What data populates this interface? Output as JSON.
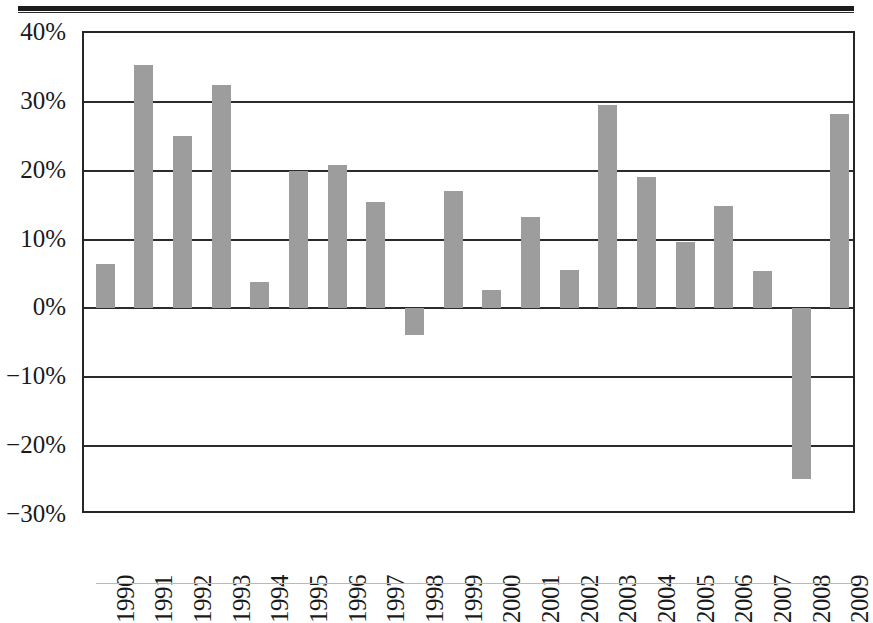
{
  "chart_data": {
    "type": "bar",
    "title": "",
    "subtitle": "",
    "xlabel": "",
    "ylabel": "",
    "categories": [
      "1990",
      "1991",
      "1992",
      "1993",
      "1994",
      "1995",
      "1996",
      "1997",
      "1998",
      "1999",
      "2000",
      "2001",
      "2002",
      "2003",
      "2004",
      "2005",
      "2006",
      "2007",
      "2008",
      "2009"
    ],
    "values": [
      6.4,
      35.3,
      25.1,
      32.5,
      3.9,
      20.0,
      20.9,
      15.5,
      -3.8,
      17.0,
      2.7,
      13.3,
      5.6,
      29.6,
      19.1,
      9.7,
      14.9,
      5.4,
      -24.8,
      28.3
    ],
    "ylim": [
      -30,
      40
    ],
    "ytick_values": [
      40,
      30,
      20,
      10,
      0,
      -10,
      -20,
      -30
    ],
    "ytick_labels": [
      "40%",
      "30%",
      "20%",
      "10%",
      "0%",
      "−10%",
      "−20%",
      "−30%"
    ],
    "grid": true,
    "grid_axis": "y",
    "legend": null,
    "legend_position": "none",
    "bar_color": "#9d9d9d",
    "axis_color": "#2b2b2b",
    "background_color": "#ffffff"
  },
  "page": {
    "top_rule": "",
    "bottom_rule": ""
  }
}
